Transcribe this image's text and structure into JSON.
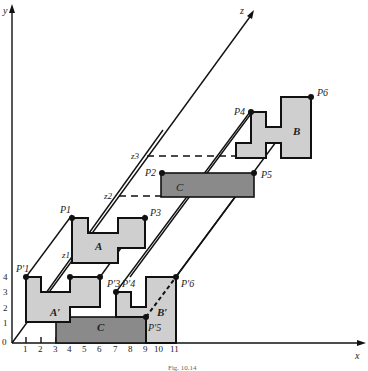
{
  "figure": {
    "caption": "Fig. 10.14",
    "axes": {
      "x_label": "x",
      "y_label": "y",
      "z_label": "z",
      "origin_label": "0",
      "x_ticks": [
        "1",
        "2",
        "3",
        "4",
        "5",
        "6",
        "7",
        "8",
        "9",
        "10",
        "11"
      ],
      "y_ticks": [
        "1",
        "2",
        "3",
        "4"
      ]
    },
    "depth_markers": [
      "z1",
      "z2",
      "z3"
    ],
    "objects": [
      {
        "name": "A",
        "label": "A",
        "shade": "light"
      },
      {
        "name": "B",
        "label": "B",
        "shade": "light"
      },
      {
        "name": "C",
        "label": "C",
        "shade": "dark"
      },
      {
        "name": "A-prime",
        "label": "A′",
        "shade": "light"
      },
      {
        "name": "B-prime",
        "label": "B′",
        "shade": "light"
      },
      {
        "name": "C-prime",
        "label": "C",
        "shade": "dark"
      }
    ],
    "points": {
      "P1": "P1",
      "P2": "P2",
      "P3": "P3",
      "P4": "P4",
      "P5": "P5",
      "P6": "P6",
      "P1p": "P′1",
      "P3p": "P′3",
      "P4p": "P′4",
      "P5p": "P′5",
      "P6p": "P′6"
    }
  }
}
